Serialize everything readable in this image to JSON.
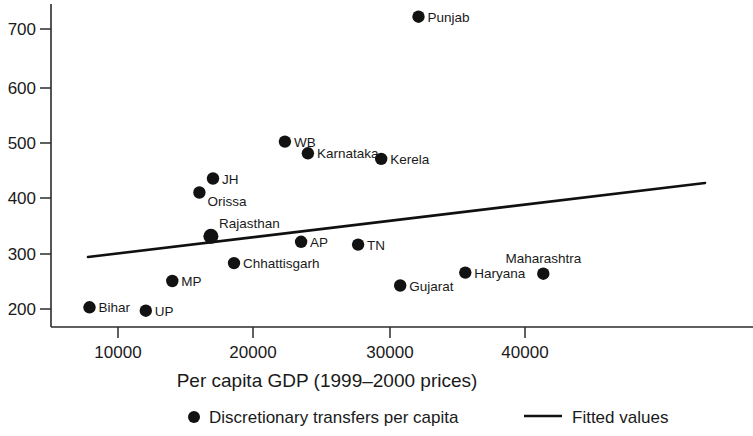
{
  "chart_data": {
    "type": "scatter",
    "title": "",
    "xlabel": "Per capita GDP (1999–2000 prices)",
    "ylabel": "",
    "xlim": [
      6600,
      43500
    ],
    "ylim": [
      185,
      740
    ],
    "xticks": [
      10000,
      20000,
      30000,
      40000
    ],
    "xtick_labels": [
      "10000",
      "20000",
      "30000",
      "40000"
    ],
    "yticks": [
      200,
      300,
      400,
      500,
      600,
      700
    ],
    "ytick_labels": [
      "200",
      "300",
      "400",
      "500",
      "600",
      "700"
    ],
    "grid": false,
    "legend_position": "below-axis",
    "legend": [
      {
        "marker": "dot",
        "label": "Discretionary transfers per capita"
      },
      {
        "marker": "line",
        "label": "Fitted values"
      }
    ],
    "series": [
      {
        "name": "Discretionary transfers per capita",
        "marker": "filled-circle",
        "color": "#121212",
        "points": [
          {
            "label": "Bihar",
            "x": 7900,
            "y": 203,
            "label_pos": "right"
          },
          {
            "label": "UP",
            "x": 12050,
            "y": 197,
            "label_pos": "right"
          },
          {
            "label": "MP",
            "x": 14000,
            "y": 250,
            "label_pos": "right"
          },
          {
            "label": "Orissa",
            "x": 16000,
            "y": 408,
            "label_pos": "right-below"
          },
          {
            "label": "JH",
            "x": 17000,
            "y": 433,
            "label_pos": "right"
          },
          {
            "label": "Rajasthan",
            "x": 16850,
            "y": 330,
            "label_pos": "right-above"
          },
          {
            "label": "Chhattisgarh",
            "x": 18550,
            "y": 282,
            "label_pos": "right"
          },
          {
            "label": "WB",
            "x": 22300,
            "y": 499,
            "label_pos": "right"
          },
          {
            "label": "AP",
            "x": 23500,
            "y": 320,
            "label_pos": "right"
          },
          {
            "label": "Karnataka",
            "x": 24000,
            "y": 478,
            "label_pos": "right"
          },
          {
            "label": "TN",
            "x": 27700,
            "y": 315,
            "label_pos": "right"
          },
          {
            "label": "Kerela",
            "x": 29400,
            "y": 468,
            "label_pos": "right"
          },
          {
            "label": "Gujarat",
            "x": 30800,
            "y": 242,
            "label_pos": "right"
          },
          {
            "label": "Punjab",
            "x": 32150,
            "y": 722,
            "label_pos": "right"
          },
          {
            "label": "Haryana",
            "x": 35600,
            "y": 265,
            "label_pos": "right"
          },
          {
            "label": "Maharashtra",
            "x": 41350,
            "y": 263,
            "label_pos": "above"
          }
        ]
      },
      {
        "name": "Fitted values",
        "type": "line",
        "color": "#101010",
        "x": [
          9350,
          54700
        ],
        "y": [
          297,
          427
        ],
        "endpoints_px": [
          [
            88,
            257
          ],
          [
            705,
            183
          ]
        ]
      }
    ]
  },
  "axes": {
    "x_title": "Per capita GDP (1999–2000 prices)"
  },
  "legend": {
    "item_dot_label": "Discretionary transfers per capita",
    "item_line_label": "Fitted values"
  }
}
